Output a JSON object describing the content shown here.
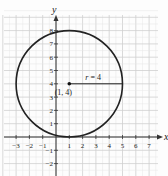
{
  "chart_data": {
    "type": "line",
    "title": "",
    "xlabel": "x",
    "ylabel": "y",
    "xlim": [
      -4,
      8
    ],
    "ylim": [
      -3,
      9
    ],
    "grid": true,
    "x_ticks": [
      "-3",
      "-2",
      "-1",
      "1",
      "2",
      "3",
      "4",
      "5",
      "6",
      "7"
    ],
    "y_ticks": [
      "-2",
      "-1",
      "1",
      "2",
      "3",
      "4",
      "5",
      "6",
      "7",
      "8"
    ],
    "circle": {
      "center": [
        1,
        4
      ],
      "radius": 4
    },
    "annotations": [
      {
        "text": "r = 4",
        "x": 3,
        "y": 4.4
      },
      {
        "text": "(1, 4)",
        "x": 1,
        "y": 3.3
      }
    ],
    "series": [
      {
        "name": "circle",
        "equation": "(x-1)^2 + (y-4)^2 = 16"
      }
    ]
  },
  "labels": {
    "x_axis": "x",
    "y_axis": "y",
    "radius": "r = 4",
    "center": "(1, 4)"
  }
}
